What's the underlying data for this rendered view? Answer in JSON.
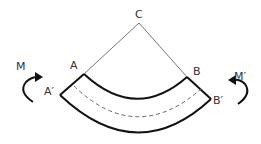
{
  "diagram": {
    "type": "beam-bending",
    "labels": {
      "center": "C",
      "inner_left": "A",
      "inner_right": "B",
      "outer_left": "A′",
      "outer_right": "B′",
      "moment_left": "M",
      "moment_right": "M′"
    },
    "colors": {
      "stroke": "#111111",
      "radial_line": "#777777",
      "neutral_axis": "#666666",
      "text": "#333333"
    }
  }
}
